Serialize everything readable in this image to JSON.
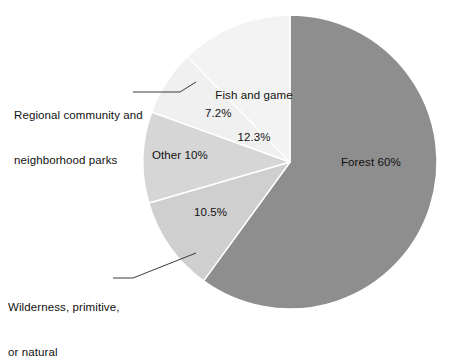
{
  "chart_data": {
    "type": "pie",
    "title": "",
    "subtitle": "",
    "xlabel": "",
    "ylabel": "",
    "grid": false,
    "legend_position": "none",
    "start_angle_deg": 0,
    "direction": "clockwise",
    "center": {
      "x": 290,
      "y": 162
    },
    "radius": 147,
    "categories": [
      "Forest",
      "Wilderness, primitive, or natural",
      "Other",
      "Regional community and neighborhood parks",
      "Fish and game"
    ],
    "values": [
      60,
      10.5,
      10,
      7.2,
      12.3
    ],
    "value_labels": [
      "60%",
      "10.5%",
      "10%",
      "7.2%",
      "12.3%"
    ],
    "colors": [
      "#8e8e8e",
      "#cfcfcf",
      "#d6d6d6",
      "#f0f0f0",
      "#f3f3f3"
    ],
    "slices": [
      {
        "name": "Forest",
        "value": 60,
        "percent_label": "60%",
        "color": "#8e8e8e",
        "label_text": "Forest 60%",
        "label_placement": "inside"
      },
      {
        "name": "Wilderness, primitive, or natural",
        "value": 10.5,
        "percent_label": "10.5%",
        "color": "#cfcfcf",
        "label_text": "10.5%",
        "label_placement": "inside",
        "callout_text_line1": "Wilderness, primitive,",
        "callout_text_line2": "or natural"
      },
      {
        "name": "Other",
        "value": 10,
        "percent_label": "10%",
        "color": "#d6d6d6",
        "label_text": "Other 10%",
        "label_placement": "inside"
      },
      {
        "name": "Regional community and neighborhood parks",
        "value": 7.2,
        "percent_label": "7.2%",
        "color": "#f0f0f0",
        "label_text": "7.2%",
        "label_placement": "inside",
        "callout_text_line1": "Regional community and",
        "callout_text_line2": "neighborhood parks"
      },
      {
        "name": "Fish and game",
        "value": 12.3,
        "percent_label": "12.3%",
        "color": "#f3f3f3",
        "label_text_line1": "Fish and game",
        "label_text_line2": "12.3%",
        "label_placement": "inside"
      }
    ]
  },
  "labels": {
    "forest": "Forest 60%",
    "fish_and_game_line1": "Fish and game",
    "fish_and_game_line2": "12.3%",
    "regional_percent": "7.2%",
    "other": "Other 10%",
    "wilderness_percent": "10.5%"
  },
  "annotations": {
    "regional": {
      "line1": "Regional community and",
      "line2": "neighborhood parks"
    },
    "wilderness": {
      "line1": "Wilderness, primitive,",
      "line2": "or natural"
    }
  },
  "colors": {
    "background": "#ffffff",
    "text": "#111111",
    "leader_line": "#3b3b3b",
    "slice_border": "#ffffff"
  }
}
